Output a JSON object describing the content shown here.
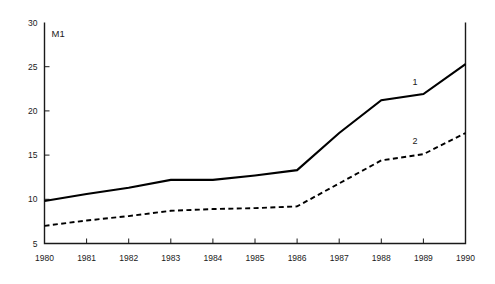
{
  "chart_data": {
    "type": "line",
    "title": "M1",
    "xlabel": "",
    "ylabel": "",
    "x": [
      1980,
      1981,
      1982,
      1983,
      1984,
      1985,
      1986,
      1987,
      1988,
      1989,
      1990
    ],
    "categories": [
      "1980",
      "1981",
      "1982",
      "1983",
      "1984",
      "1985",
      "1986",
      "1987",
      "1988",
      "1989",
      "1990"
    ],
    "series": [
      {
        "name": "1",
        "style": "solid",
        "color": "#000000",
        "label": "1",
        "values": [
          9.8,
          10.6,
          11.3,
          12.2,
          12.2,
          12.7,
          13.3,
          17.5,
          21.2,
          21.9,
          25.3
        ]
      },
      {
        "name": "2",
        "style": "dashed",
        "color": "#000000",
        "label": "2",
        "values": [
          7.0,
          7.6,
          8.1,
          8.7,
          8.9,
          9.0,
          9.2,
          11.8,
          14.4,
          15.1,
          17.5
        ]
      }
    ],
    "xlim": [
      1980,
      1990
    ],
    "ylim": [
      5,
      30
    ],
    "y_ticks": [
      5,
      10,
      15,
      20,
      25,
      30
    ],
    "y_tick_labels": [
      "5",
      "10",
      "15",
      "20",
      "25",
      "30"
    ],
    "x_ticks": [
      1980,
      1981,
      1982,
      1983,
      1984,
      1985,
      1986,
      1987,
      1988,
      1989,
      1990
    ],
    "x_tick_labels": [
      "1980",
      "1981",
      "1982",
      "1983",
      "1984",
      "1985",
      "1986",
      "1987",
      "1988",
      "1989",
      "1990"
    ],
    "grid": false,
    "legend": "inline-annotations",
    "annotations": [
      {
        "text": "1",
        "x": 1988.8,
        "y": 22.9
      },
      {
        "text": "2",
        "x": 1988.8,
        "y": 16.3
      }
    ]
  }
}
